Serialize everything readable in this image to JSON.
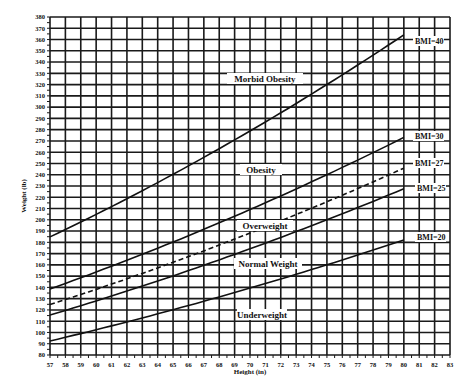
{
  "chart_data": {
    "type": "line",
    "title": "",
    "xlabel": "Height (in)",
    "ylabel": "Weight (lb)",
    "xlim": [
      57,
      83
    ],
    "ylim": [
      80,
      380
    ],
    "grid": true,
    "x_ticks": [
      57,
      58,
      59,
      60,
      61,
      62,
      63,
      64,
      65,
      66,
      67,
      68,
      69,
      70,
      71,
      72,
      73,
      74,
      75,
      76,
      77,
      78,
      79,
      80,
      81,
      82,
      83
    ],
    "y_ticks": [
      80,
      90,
      100,
      110,
      120,
      130,
      140,
      150,
      160,
      170,
      180,
      190,
      200,
      210,
      220,
      230,
      240,
      250,
      260,
      270,
      280,
      290,
      300,
      310,
      320,
      330,
      340,
      350,
      360,
      370,
      380
    ],
    "x": [
      57,
      60,
      65,
      70,
      75,
      80
    ],
    "series": [
      {
        "name": "BMI=20",
        "style": "solid",
        "values": [
          92.4,
          102.4,
          120.2,
          139.4,
          160.0,
          182.1
        ]
      },
      {
        "name": "BMI=25",
        "style": "solid",
        "values": [
          115.5,
          128.0,
          150.2,
          174.3,
          200.0,
          227.6
        ]
      },
      {
        "name": "BMI=27",
        "style": "dashed",
        "values": [
          124.8,
          138.3,
          162.3,
          188.2,
          216.0,
          245.8
        ]
      },
      {
        "name": "BMI=30",
        "style": "solid",
        "values": [
          138.7,
          153.6,
          180.3,
          209.1,
          240.0,
          273.1
        ]
      },
      {
        "name": "BMI=40",
        "style": "solid",
        "values": [
          184.9,
          204.8,
          240.4,
          278.8,
          320.1,
          364.1
        ]
      }
    ],
    "annotations": [
      {
        "text": "Morbid Obesity",
        "x": 69.5,
        "y": 312
      },
      {
        "text": "Obesity",
        "x": 69.5,
        "y": 234
      },
      {
        "text": "Overweight",
        "x": 69.5,
        "y": 196
      },
      {
        "text": "Normal Weight",
        "x": 69.5,
        "y": 161
      },
      {
        "text": "Underweight",
        "x": 69.5,
        "y": 117
      }
    ]
  },
  "axes": {
    "xlabel": "Height (in)",
    "ylabel": "Weight (lb)"
  },
  "regions": {
    "morbid_obesity": "Morbid Obesity",
    "obesity": "Obesity",
    "overweight": "Overweight",
    "normal_weight": "Normal Weight",
    "underweight": "Underweight"
  },
  "legend": {
    "bmi40": "BMI=40",
    "bmi30": "BMI=30",
    "bmi27": "BMI=27",
    "bmi25": "BMI=25",
    "bmi20": "BMI=20"
  },
  "colors": {
    "line": "#111111",
    "grid": "#1a1a1a",
    "background": "#ffffff"
  }
}
